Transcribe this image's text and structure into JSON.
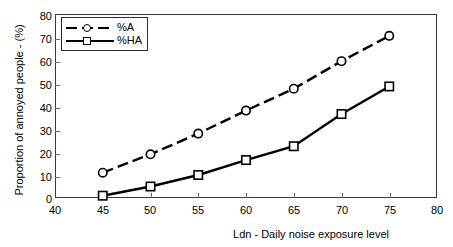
{
  "chart_data": {
    "type": "line",
    "title": "",
    "xlabel": "Ldn - Daily noise exposure level",
    "ylabel": "Proportion of annoyed people - (%)",
    "xlim": [
      40,
      80
    ],
    "ylim": [
      0,
      80
    ],
    "xticks": [
      40,
      45,
      50,
      55,
      60,
      65,
      70,
      75,
      80
    ],
    "yticks": [
      0,
      10,
      20,
      30,
      40,
      50,
      60,
      70,
      80
    ],
    "xtick_labels": [
      "40",
      "45",
      "50",
      "55",
      "60",
      "65",
      "70",
      "75",
      "80"
    ],
    "ytick_labels": [
      "0",
      "10",
      "20",
      "30",
      "40",
      "50",
      "60",
      "70",
      "80"
    ],
    "grid": false,
    "legend_position": "top-left",
    "x": [
      45,
      50,
      55,
      60,
      65,
      70,
      75
    ],
    "series": [
      {
        "name": "%A",
        "values": [
          11,
          19,
          28,
          38,
          47.5,
          59.5,
          70.5
        ],
        "marker": "circle",
        "linestyle": "dashed",
        "color": "#000000"
      },
      {
        "name": "%HA",
        "values": [
          1,
          5,
          10,
          16.5,
          22.5,
          36.5,
          48.5
        ],
        "marker": "square",
        "linestyle": "solid",
        "color": "#000000"
      }
    ]
  },
  "legend": {
    "entries": [
      {
        "label": "%A"
      },
      {
        "label": "%HA"
      }
    ]
  },
  "colors": {
    "axis": "#3a3a3a",
    "tick": "#6a6a6a",
    "line": "#000000",
    "background": "#ffffff"
  }
}
